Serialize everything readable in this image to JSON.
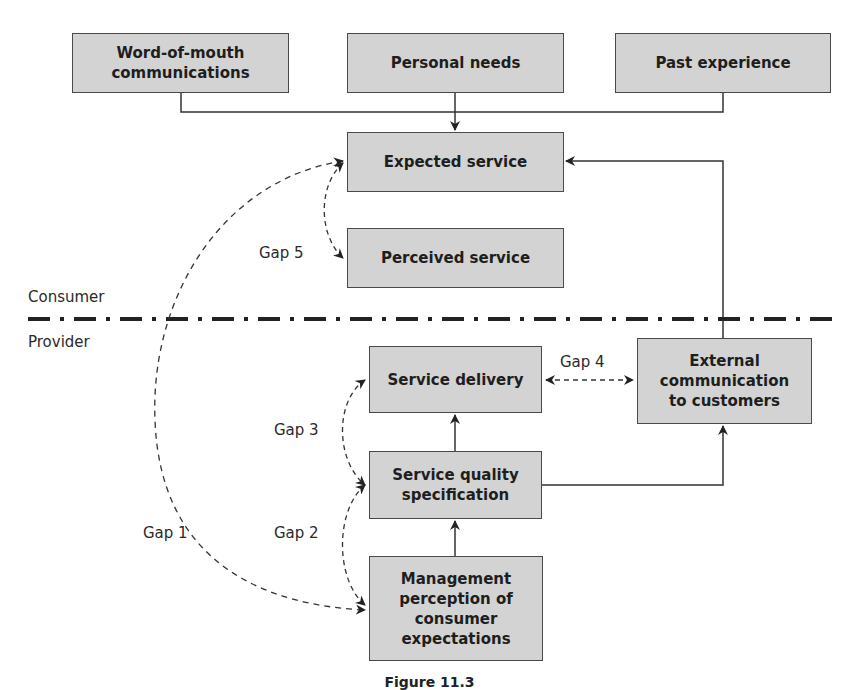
{
  "boxes": {
    "word_of_mouth": "Word-of-mouth\ncommunications",
    "personal_needs": "Personal needs",
    "past_experience": "Past experience",
    "expected_service": "Expected service",
    "perceived_service": "Perceived service",
    "service_delivery": "Service delivery",
    "external_communication": "External\ncommunication\nto customers",
    "service_quality_spec": "Service quality\nspecification",
    "management_perception": "Management\nperception of\nconsumer\nexpectations"
  },
  "zones": {
    "consumer": "Consumer",
    "provider": "Provider"
  },
  "gaps": {
    "gap1": "Gap 1",
    "gap2": "Gap 2",
    "gap3": "Gap 3",
    "gap4": "Gap 4",
    "gap5": "Gap 5"
  },
  "caption": "Figure 11.3",
  "colors": {
    "box_fill": "#d3d3d3",
    "box_border": "#4a4a4a",
    "line": "#333333"
  }
}
